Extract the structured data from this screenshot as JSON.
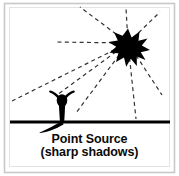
{
  "figure": {
    "caption_line1": "Point Source",
    "caption_line2": "(sharp shadows)",
    "colors": {
      "background": "#ffffff",
      "ink": "#000000",
      "ray": "#3a3a3a",
      "border": "#c8c8c8",
      "caption": "#0a0a0a"
    },
    "elements": {
      "light_source_name": "point-light-star",
      "ground_line_name": "ground-line",
      "person_name": "standing-person",
      "shadow_name": "sharp-shadow",
      "rays_name": "light-rays"
    },
    "light_source": {
      "label": "point source of light",
      "x": 128,
      "y": 43,
      "outer_radius": 14,
      "inner_radius": 6,
      "points": 9
    },
    "ground": {
      "label": "ground",
      "y": 122,
      "x_start": 10,
      "x_end": 170,
      "thickness": 3
    },
    "person": {
      "label": "person standing on ground",
      "head_x": 62,
      "head_y": 100,
      "head_rx": 5.2,
      "head_ry": 6.2,
      "feet_x": 62,
      "feet_y": 122
    },
    "shadow": {
      "label": "sharp shadow cast away from point source",
      "direction": "down-left",
      "tip_x": 38,
      "tip_y": 133
    },
    "rays": [
      {
        "name": "ray-left-horizontal",
        "angle_deg": 180,
        "length": 72
      },
      {
        "name": "ray-up-left-steep",
        "angle_deg": 217,
        "length": 60
      },
      {
        "name": "ray-up",
        "angle_deg": 268,
        "length": 42
      },
      {
        "name": "ray-up-right",
        "angle_deg": 315,
        "length": 44
      },
      {
        "name": "ray-down-left-far",
        "angle_deg": 160,
        "length": 128
      },
      {
        "name": "ray-down-left-to-person",
        "angle_deg": 148,
        "length": 78
      },
      {
        "name": "ray-down-left-short",
        "angle_deg": 126,
        "length": 72
      },
      {
        "name": "ray-down-right-steep",
        "angle_deg": 84,
        "length": 76
      },
      {
        "name": "ray-down-right",
        "angle_deg": 58,
        "length": 62
      }
    ]
  }
}
